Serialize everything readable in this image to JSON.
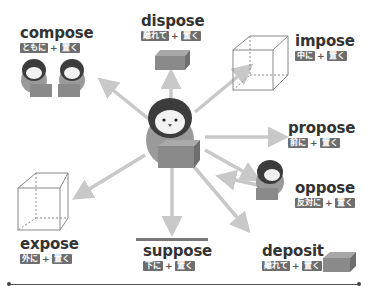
{
  "center": {
    "label": "penguin-holding-box"
  },
  "words": [
    {
      "id": "compose",
      "en": "compose",
      "prefix": "ともに",
      "plus": "+",
      "root": "置く"
    },
    {
      "id": "dispose",
      "en": "dispose",
      "prefix": "離れて",
      "plus": "+",
      "root": "置く"
    },
    {
      "id": "impose",
      "en": "impose",
      "prefix": "中に",
      "plus": "+",
      "root": "置く"
    },
    {
      "id": "propose",
      "en": "propose",
      "prefix": "前に",
      "plus": "+",
      "root": "置く"
    },
    {
      "id": "oppose",
      "en": "oppose",
      "prefix": "反対に",
      "plus": "+",
      "root": "置く"
    },
    {
      "id": "deposit",
      "en": "deposit",
      "prefix": "離れて",
      "plus": "+",
      "root": "置く"
    },
    {
      "id": "suppose",
      "en": "suppose",
      "prefix": "下に",
      "plus": "+",
      "root": "置く"
    },
    {
      "id": "expose",
      "en": "expose",
      "prefix": "外に",
      "plus": "+",
      "root": "置く"
    }
  ],
  "colors": {
    "arrow": "#c8c8c8",
    "tag": "#6e6e6e",
    "text": "#333333",
    "box": "#8a8a8a",
    "penguin_dark": "#3c3c3c"
  }
}
